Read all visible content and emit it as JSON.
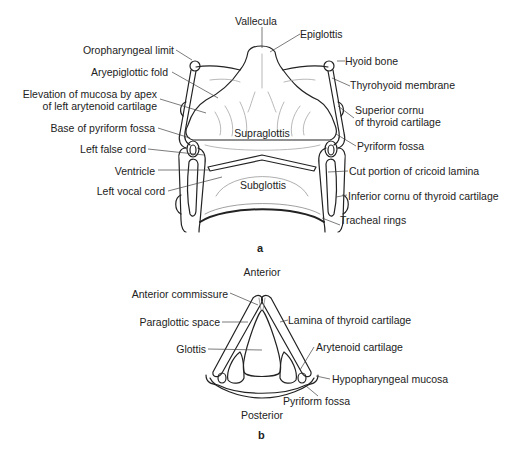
{
  "figure": {
    "panel_a": {
      "letter": "a",
      "labels": {
        "vallecula": "Vallecula",
        "epiglottis": "Epiglottis",
        "oropharyngeal_limit": "Oropharyngeal limit",
        "hyoid_bone": "Hyoid bone",
        "aryepiglottic_fold": "Aryepiglottic fold",
        "thyrohyoid_membrane": "Thyrohyoid membrane",
        "elevation_line1": "Elevation of mucosa by apex",
        "elevation_line2": "of left arytenoid cartilage",
        "superior_cornu_line1": "Superior cornu",
        "superior_cornu_line2": "of thyroid cartilage",
        "base_pyriform_fossa": "Base of pyriform fossa",
        "pyriform_fossa": "Pyriform fossa",
        "supraglottis": "Supraglottis",
        "left_false_cord": "Left false cord",
        "cut_cricoid": "Cut portion of cricoid lamina",
        "ventricle": "Ventricle",
        "left_vocal_cord": "Left vocal cord",
        "subglottis": "Subglottis",
        "inferior_cornu": "Inferior cornu of thyroid cartilage",
        "tracheal_rings": "Tracheal rings"
      }
    },
    "panel_b": {
      "letter": "b",
      "labels": {
        "anterior": "Anterior",
        "anterior_commissure": "Anterior commissure",
        "paraglottic_space": "Paraglottic space",
        "lamina_thyroid": "Lamina of thyroid cartilage",
        "glottis": "Glottis",
        "arytenoid": "Arytenoid cartilage",
        "hypopharyngeal_mucosa": "Hypopharyngeal mucosa",
        "pyriform_fossa": "Pyriform fossa",
        "posterior": "Posterior"
      }
    }
  }
}
